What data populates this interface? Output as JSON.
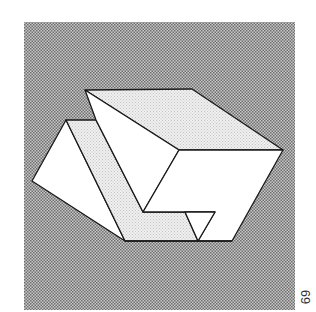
{
  "figure": {
    "background_color": "#a9a9a9",
    "face_white": "#ffffff",
    "face_light": "#e6e6e6",
    "stroke_color": "#1a1a1a"
  },
  "page_number": "69"
}
